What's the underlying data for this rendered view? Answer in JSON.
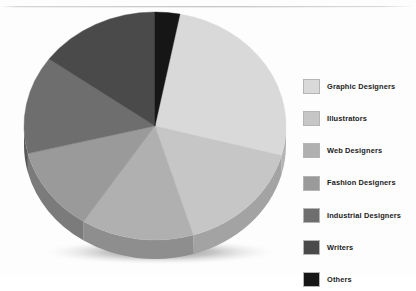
{
  "chart_data": {
    "type": "pie",
    "title": "",
    "subtitle": "",
    "style": "3d-pie",
    "legend_position": "right",
    "grid": false,
    "start_angle_deg": 0,
    "direction": "clockwise",
    "categories": [
      "Graphic Designers",
      "Illustrators",
      "Web Designers",
      "Fashion Designers",
      "Industrial Designers",
      "Writers",
      "Others"
    ],
    "values": [
      26,
      16,
      14,
      12,
      14,
      15,
      3
    ],
    "units": "percent",
    "colors": [
      "#d9d9d9",
      "#c6c6c6",
      "#b0b0b0",
      "#9a9a9a",
      "#6e6e6e",
      "#4a4a4a",
      "#161616"
    ],
    "side_colors": [
      "#b4b4b4",
      "#a3a3a3",
      "#8e8e8e",
      "#7b7b7b",
      "#585858",
      "#3a3a3a",
      "#101010"
    ],
    "slices": [
      {
        "label": "Graphic Designers",
        "value": 26,
        "color": "#d9d9d9",
        "start_deg": 11,
        "end_deg": 105
      },
      {
        "label": "Illustrators",
        "value": 16,
        "color": "#c6c6c6",
        "start_deg": 105,
        "end_deg": 163
      },
      {
        "label": "Web Designers",
        "value": 14,
        "color": "#b0b0b0",
        "start_deg": 163,
        "end_deg": 213
      },
      {
        "label": "Fashion Designers",
        "value": 12,
        "color": "#9a9a9a",
        "start_deg": 213,
        "end_deg": 256
      },
      {
        "label": "Industrial Designers",
        "value": 14,
        "color": "#6e6e6e",
        "start_deg": 256,
        "end_deg": 306
      },
      {
        "label": "Writers",
        "value": 15,
        "color": "#4a4a4a",
        "start_deg": 306,
        "end_deg": 360
      },
      {
        "label": "Others",
        "value": 3,
        "color": "#161616",
        "start_deg": 0,
        "end_deg": 11
      }
    ]
  },
  "legend": {
    "items": [
      {
        "label": "Graphic Designers",
        "color": "#d9d9d9"
      },
      {
        "label": "Illustrators",
        "color": "#c6c6c6"
      },
      {
        "label": "Web Designers",
        "color": "#b0b0b0"
      },
      {
        "label": "Fashion Designers",
        "color": "#9a9a9a"
      },
      {
        "label": "Industrial Designers",
        "color": "#6e6e6e"
      },
      {
        "label": "Writers",
        "color": "#4a4a4a"
      },
      {
        "label": "Others",
        "color": "#161616"
      }
    ]
  }
}
